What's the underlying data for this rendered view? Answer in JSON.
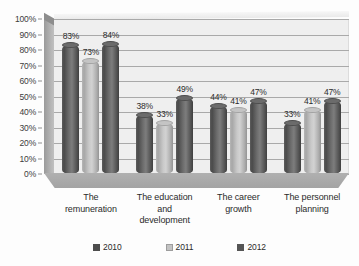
{
  "chart_data": {
    "type": "bar",
    "title": "",
    "subtitle": "",
    "xlabel": "",
    "ylabel": "",
    "ylim": [
      0,
      100
    ],
    "grid": true,
    "legend_position": "bottom",
    "value_suffix": "%",
    "categories": [
      "The remuneration",
      "The education and development",
      "The career growth",
      "The personnel planning"
    ],
    "category_lines": [
      [
        "The",
        "remuneration"
      ],
      [
        "The education",
        "and",
        "development"
      ],
      [
        "The career",
        "growth"
      ],
      [
        "The personnel",
        "planning"
      ]
    ],
    "series": [
      {
        "name": "2010",
        "color": "#4d4d4d",
        "tone": "dark",
        "values": [
          83,
          38,
          44,
          33
        ],
        "labels": [
          "83%",
          "38%",
          "44%",
          "33%"
        ]
      },
      {
        "name": "2011",
        "color": "#c3c3c3",
        "tone": "light",
        "values": [
          73,
          33,
          41,
          41
        ],
        "labels": [
          "73%",
          "33%",
          "41%",
          "41%"
        ]
      },
      {
        "name": "2012",
        "color": "#555555",
        "tone": "dark2",
        "values": [
          84,
          49,
          47,
          47
        ],
        "labels": [
          "84%",
          "49%",
          "47%",
          "47%"
        ]
      }
    ],
    "y_ticks": [
      {
        "value": 100,
        "label": "100%"
      },
      {
        "value": 90,
        "label": "90%"
      },
      {
        "value": 80,
        "label": "80%"
      },
      {
        "value": 70,
        "label": "70%"
      },
      {
        "value": 60,
        "label": "60%"
      },
      {
        "value": 50,
        "label": "50%"
      },
      {
        "value": 40,
        "label": "40%"
      },
      {
        "value": 30,
        "label": "30%"
      },
      {
        "value": 20,
        "label": "20%"
      },
      {
        "value": 10,
        "label": "10%"
      },
      {
        "value": 0,
        "label": "0%"
      }
    ],
    "colors": {
      "plot_background": "#efefef",
      "gridline": "#a9a9a9",
      "floor": "#a9a9a9",
      "side_wall": "#b0b0b0",
      "text": "#2b2b2b"
    }
  }
}
